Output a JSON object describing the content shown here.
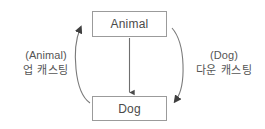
{
  "diagram": {
    "type": "class-casting-diagram",
    "background_color": "#ffffff",
    "nodes": [
      {
        "id": "animal",
        "label": "Animal",
        "border_color": "#9b9b9b",
        "text_color": "#4a4a4a"
      },
      {
        "id": "dog",
        "label": "Dog",
        "border_color": "#9b9b9b",
        "text_color": "#4a4a4a"
      }
    ],
    "edges": [
      {
        "id": "inheritance",
        "from": "animal",
        "to": "dog",
        "shape": "straight",
        "direction": "down",
        "label": ""
      },
      {
        "id": "upcasting",
        "from": "dog",
        "to": "animal",
        "shape": "curve-left",
        "direction": "up",
        "label_type": "(Animal)",
        "label_korean": "업 캐스팅"
      },
      {
        "id": "downcasting",
        "from": "animal",
        "to": "dog",
        "shape": "curve-right",
        "direction": "down",
        "label_type": "(Dog)",
        "label_korean": "다운 캐스팅"
      }
    ],
    "labels": {
      "left": {
        "type_cast": "(Animal)",
        "korean": "업 캐스팅"
      },
      "right": {
        "type_cast": "(Dog)",
        "korean": "다운 캐스팅"
      }
    },
    "stroke_color": "#6f6f6f",
    "label_color": "#555555"
  }
}
